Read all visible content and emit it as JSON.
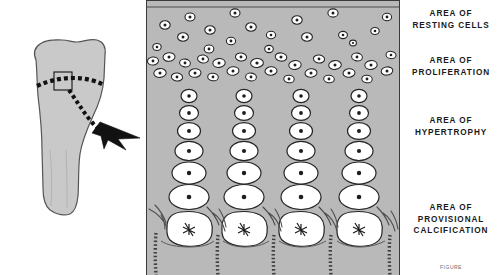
{
  "figure": {
    "caption": "FIGURE",
    "background_color": "#ffffff"
  },
  "bone_figure": {
    "name": "long-bone-end",
    "fill_color": "#c9c9c9",
    "outline_color": "#4a4a4a",
    "growth_plate_line": "dashed",
    "callout_box": "magnified-region",
    "arrow": "dotted-pointer-arrow"
  },
  "histology_panel": {
    "background_color": "#b9b9b9",
    "border_color": "#3a3a3a",
    "cell_fill_color": "#ffffff",
    "cell_outline_color": "#2a2a2a",
    "column_count": 4,
    "zones": [
      {
        "id": "resting",
        "name": "Area of resting cells",
        "cell_shape": "small-round-scattered"
      },
      {
        "id": "proliferation",
        "name": "Area of proliferation",
        "cell_shape": "flattened-dense-band"
      },
      {
        "id": "hypertrophy",
        "name": "Area of hypertrophy",
        "cell_shape": "enlarging-columnar"
      },
      {
        "id": "calcification",
        "name": "Area of provisional calcification",
        "cell_shape": "large-lacunae-with-trabeculae"
      }
    ]
  },
  "labels": {
    "resting": {
      "line1": "AREA OF",
      "line2": "RESTING CELLS"
    },
    "proliferation": {
      "line1": "AREA OF",
      "line2": "PROLIFERATION"
    },
    "hypertrophy": {
      "line1": "AREA OF",
      "line2": "HYPERTROPHY"
    },
    "calcification": {
      "line1": "AREA OF",
      "line2": "PROVISIONAL",
      "line3": "CALCIFICATION"
    }
  }
}
